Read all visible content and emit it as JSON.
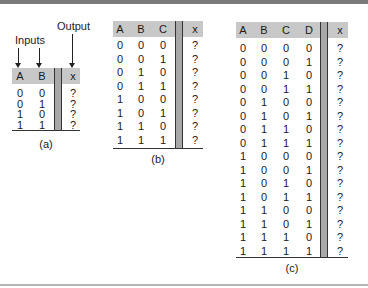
{
  "annotations": {
    "inputs_label": "Inputs",
    "output_label": "Output"
  },
  "tables": [
    {
      "caption": "(a)",
      "inputs": [
        "A",
        "B"
      ],
      "output": "x",
      "rows": [
        [
          "0",
          "0",
          "?"
        ],
        [
          "0",
          "1",
          "?"
        ],
        [
          "1",
          "0",
          "?"
        ],
        [
          "1",
          "1",
          "?"
        ]
      ]
    },
    {
      "caption": "(b)",
      "inputs": [
        "A",
        "B",
        "C"
      ],
      "output": "x",
      "rows": [
        [
          "0",
          "0",
          "0",
          "?"
        ],
        [
          "0",
          "0",
          "1",
          "?"
        ],
        [
          "0",
          "1",
          "0",
          "?"
        ],
        [
          "0",
          "1",
          "1",
          "?"
        ],
        [
          "1",
          "0",
          "0",
          "?"
        ],
        [
          "1",
          "0",
          "1",
          "?"
        ],
        [
          "1",
          "1",
          "0",
          "?"
        ],
        [
          "1",
          "1",
          "1",
          "?"
        ]
      ]
    },
    {
      "caption": "(c)",
      "inputs": [
        "A",
        "B",
        "C",
        "D"
      ],
      "output": "x",
      "rows": [
        [
          "0",
          "0",
          "0",
          "0",
          "?"
        ],
        [
          "0",
          "0",
          "0",
          "1",
          "?"
        ],
        [
          "0",
          "0",
          "1",
          "0",
          "?"
        ],
        [
          "0",
          "0",
          "1",
          "1",
          "?"
        ],
        [
          "0",
          "1",
          "0",
          "0",
          "?"
        ],
        [
          "0",
          "1",
          "0",
          "1",
          "?"
        ],
        [
          "0",
          "1",
          "1",
          "0",
          "?"
        ],
        [
          "0",
          "1",
          "1",
          "1",
          "?"
        ],
        [
          "1",
          "0",
          "0",
          "0",
          "?"
        ],
        [
          "1",
          "0",
          "0",
          "1",
          "?"
        ],
        [
          "1",
          "0",
          "1",
          "0",
          "?"
        ],
        [
          "1",
          "0",
          "1",
          "1",
          "?"
        ],
        [
          "1",
          "1",
          "0",
          "0",
          "?"
        ],
        [
          "1",
          "1",
          "0",
          "1",
          "?"
        ],
        [
          "1",
          "1",
          "1",
          "0",
          "?"
        ],
        [
          "1",
          "1",
          "1",
          "1",
          "?"
        ]
      ]
    }
  ],
  "colors": {
    "header_bg": "#c8c8c8",
    "divider": "#a8a8a8",
    "rule": "#7a7a7a"
  }
}
